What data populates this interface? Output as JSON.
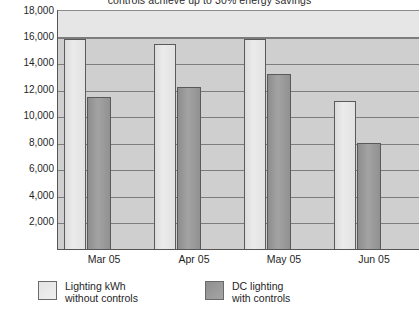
{
  "chart_data": {
    "type": "bar",
    "title": "controls achieve up to 30% energy savings",
    "xlabel": "",
    "ylabel": "",
    "categories": [
      "Mar 05",
      "Apr 05",
      "May 05",
      "Jun 05"
    ],
    "series": [
      {
        "name": "Lighting kWh without controls",
        "color": "#e2e2e2",
        "values": [
          16500,
          16100,
          16500,
          11700
        ]
      },
      {
        "name": "DC lighting with controls",
        "color": "#969696",
        "values": [
          12000,
          12750,
          13800,
          8400
        ]
      }
    ],
    "yticks": [
      "2,000",
      "4,000",
      "6,000",
      "8,000",
      "10,000",
      "12,000",
      "14,000",
      "16,000",
      "18,000"
    ],
    "ytick_values": [
      2000,
      4000,
      6000,
      8000,
      10000,
      12000,
      14000,
      16000,
      18000
    ],
    "ylim": [
      0,
      18800
    ],
    "grid": true,
    "legend_position": "bottom",
    "plot_background": "#cfcfcf",
    "gridline_color": "#7d7d7d"
  },
  "legend": {
    "items": [
      {
        "line1": "Lighting kWh",
        "line2": "without controls"
      },
      {
        "line1": "DC lighting",
        "line2": "with controls"
      }
    ]
  }
}
